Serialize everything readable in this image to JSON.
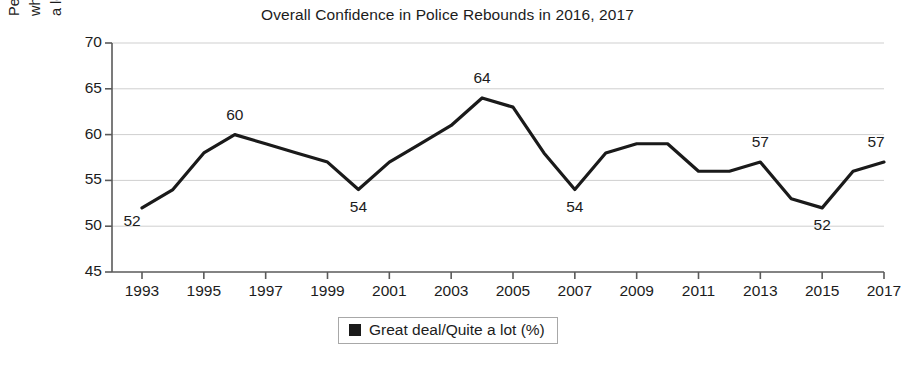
{
  "chart_data": {
    "type": "line",
    "title": "Overall Confidence in Police Rebounds in 2016, 2017",
    "xlabel": "",
    "ylabel_lines": [
      "Percentage of all American adults",
      "who have \"a great deal\" or \"quite",
      "a lot\" of confidence in the police"
    ],
    "ylim": [
      45,
      70
    ],
    "yticks": [
      45,
      50,
      55,
      60,
      65,
      70
    ],
    "ytick_labels": [
      "45",
      "50",
      "55",
      "60",
      "65",
      "70"
    ],
    "xlim": [
      1993,
      2017
    ],
    "xticks": [
      1993,
      1995,
      1997,
      1999,
      2001,
      2003,
      2005,
      2007,
      2009,
      2011,
      2013,
      2015,
      2017
    ],
    "xtick_labels": [
      "1993",
      "1995",
      "1997",
      "1999",
      "2001",
      "2003",
      "2005",
      "2007",
      "2009",
      "2011",
      "2013",
      "2015",
      "2017"
    ],
    "grid": "horizontal",
    "legend_position": "bottom-center",
    "series": [
      {
        "name": "Great deal/Quite a lot (%)",
        "color": "#1a1a1a",
        "x": [
          1993,
          1994,
          1995,
          1996,
          1997,
          1998,
          1999,
          2000,
          2001,
          2002,
          2003,
          2004,
          2005,
          2006,
          2007,
          2008,
          2009,
          2010,
          2011,
          2012,
          2013,
          2014,
          2015,
          2016,
          2017
        ],
        "values": [
          52,
          54,
          58,
          60,
          59,
          58,
          57,
          54,
          57,
          59,
          61,
          64,
          63,
          58,
          54,
          58,
          59,
          59,
          56,
          56,
          57,
          53,
          52,
          56,
          57
        ]
      }
    ],
    "point_labels": [
      {
        "x": 1993,
        "y": 52,
        "text": "52",
        "placement": "below-left"
      },
      {
        "x": 1996,
        "y": 60,
        "text": "60",
        "placement": "above"
      },
      {
        "x": 2000,
        "y": 54,
        "text": "54",
        "placement": "below"
      },
      {
        "x": 2004,
        "y": 64,
        "text": "64",
        "placement": "above"
      },
      {
        "x": 2007,
        "y": 54,
        "text": "54",
        "placement": "below"
      },
      {
        "x": 2013,
        "y": 57,
        "text": "57",
        "placement": "above"
      },
      {
        "x": 2015,
        "y": 52,
        "text": "52",
        "placement": "below"
      },
      {
        "x": 2017,
        "y": 57,
        "text": "57",
        "placement": "above"
      }
    ]
  },
  "legend": {
    "label": "Great deal/Quite a lot (%)",
    "swatch_color": "#1a1a1a"
  }
}
